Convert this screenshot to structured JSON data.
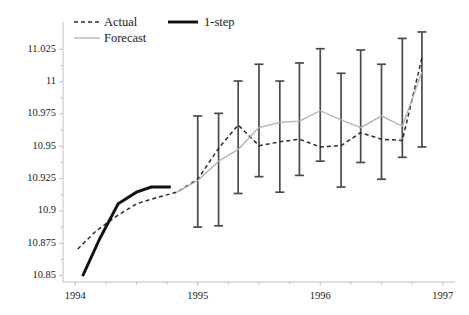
{
  "chart_data": {
    "type": "line",
    "title": "",
    "subtitle": "",
    "xlabel": "",
    "ylabel": "",
    "grid": false,
    "legend_position": "top-left",
    "xlim": [
      1993.9,
      1997.1
    ],
    "ylim": [
      10.845,
      11.04
    ],
    "x_ticks": [
      1994,
      1995,
      1996,
      1997
    ],
    "x_tick_labels": [
      "1994",
      "1995",
      "1996",
      "1997"
    ],
    "y_ticks": [
      10.85,
      10.875,
      10.9,
      10.925,
      10.95,
      10.975,
      11,
      11.025
    ],
    "y_tick_labels": [
      "10.85",
      "10.875",
      "10.9",
      "10.925",
      "10.95",
      "10.975",
      "11",
      "11.025"
    ],
    "x_minor_ticks": [
      1994.25,
      1994.5,
      1994.75,
      1995.25,
      1995.5,
      1995.75,
      1996.25,
      1996.5,
      1996.75
    ],
    "series": [
      {
        "name": "Actual",
        "style": "dashed",
        "color": "#2b2b2b",
        "x": [
          1994.02,
          1994.17,
          1994.33,
          1994.5,
          1994.67,
          1994.83,
          1995.0,
          1995.17,
          1995.33,
          1995.5,
          1995.67,
          1995.83,
          1996.0,
          1996.17,
          1996.33,
          1996.5,
          1996.67,
          1996.83
        ],
        "values": [
          10.8705,
          10.8845,
          10.8955,
          10.9055,
          10.9105,
          10.9145,
          10.9245,
          10.9485,
          10.9665,
          10.9505,
          10.9535,
          10.9555,
          10.9495,
          10.9505,
          10.9605,
          10.9555,
          10.9545,
          11.0185
        ]
      },
      {
        "name": "Forecast",
        "style": "solid-thin",
        "color": "#b0b0b0",
        "x": [
          1994.83,
          1995.0,
          1995.17,
          1995.33,
          1995.5,
          1995.67,
          1995.83,
          1996.0,
          1996.17,
          1996.33,
          1996.5,
          1996.67,
          1996.83
        ],
        "values": [
          10.9145,
          10.9235,
          10.9385,
          10.9475,
          10.9645,
          10.9685,
          10.9695,
          10.9775,
          10.9705,
          10.9645,
          10.9735,
          10.9655,
          11.0075
        ]
      },
      {
        "name": "1-step",
        "style": "solid-thick",
        "color": "#101010",
        "x": [
          1994.06,
          1994.2,
          1994.35,
          1994.5,
          1994.62,
          1994.78
        ],
        "values": [
          10.8495,
          10.8785,
          10.9055,
          10.9145,
          10.9185,
          10.9185
        ]
      }
    ],
    "error_bars": {
      "name": "Forecast interval",
      "color": "#4a4a4a",
      "x": [
        1995.0,
        1995.17,
        1995.33,
        1995.5,
        1995.67,
        1995.83,
        1996.0,
        1996.17,
        1996.33,
        1996.5,
        1996.67,
        1996.83
      ],
      "center": [
        10.9235,
        10.9385,
        10.9475,
        10.9645,
        10.9685,
        10.9695,
        10.9775,
        10.9705,
        10.9645,
        10.9735,
        10.9655,
        11.0075
      ],
      "upper": [
        10.9735,
        10.9755,
        11.0005,
        11.0135,
        11.0005,
        11.0145,
        11.0255,
        11.0065,
        11.0245,
        11.0135,
        11.0335,
        11.0385
      ],
      "lower": [
        10.8875,
        10.8885,
        10.9135,
        10.9265,
        10.9145,
        10.9275,
        10.9385,
        10.9185,
        10.9375,
        10.9245,
        10.9415,
        10.9495
      ]
    }
  },
  "legend": {
    "items": [
      {
        "label": "Actual",
        "style": "dashed"
      },
      {
        "label": "1-step",
        "style": "solid-thick"
      },
      {
        "label": "Forecast",
        "style": "solid-thin"
      }
    ]
  },
  "axes": {
    "y_labels": [
      "11.025",
      "11",
      "10.975",
      "10.95",
      "10.925",
      "10.9",
      "10.875",
      "10.85"
    ],
    "x_labels": [
      "1994",
      "1995",
      "1996",
      "1997"
    ]
  }
}
